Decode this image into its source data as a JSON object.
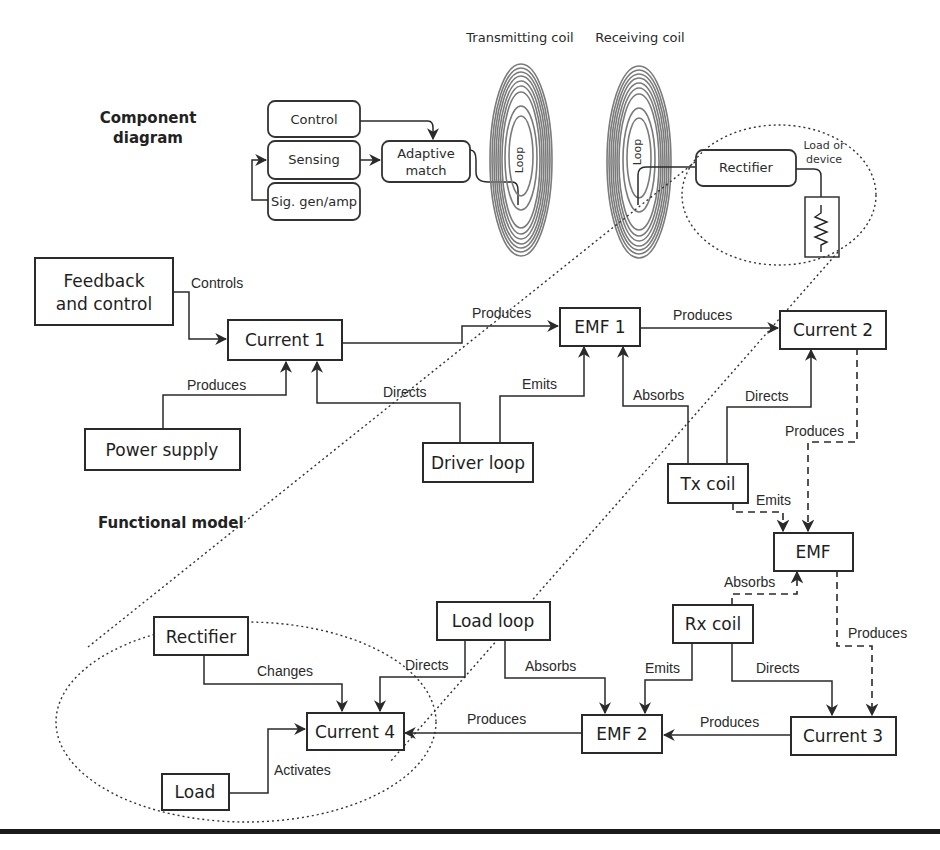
{
  "headings": {
    "component_diagram_line1": "Component",
    "component_diagram_line2": "diagram",
    "functional_model": "Functional model"
  },
  "component_diagram": {
    "transmitting_coil_label": "Transmitting coil",
    "receiving_coil_label": "Receiving coil",
    "tx_loop_label": "Loop",
    "rx_loop_label": "Loop",
    "blocks": {
      "control": "Control",
      "sensing": "Sensing",
      "sig_gen": "Sig. gen/amp",
      "adaptive_match_line1": "Adaptive",
      "adaptive_match_line2": "match",
      "rectifier": "Rectifier",
      "load_line1": "Load or",
      "load_line2": "device"
    }
  },
  "functional_model": {
    "nodes": {
      "feedback_line1": "Feedback",
      "feedback_line2": "and control",
      "current1": "Current 1",
      "power_supply": "Power supply",
      "driver_loop": "Driver loop",
      "emf1": "EMF 1",
      "current2": "Current 2",
      "tx_coil": "Tx coil",
      "emf": "EMF",
      "rx_coil": "Rx coil",
      "load_loop": "Load loop",
      "rectifier": "Rectifier",
      "current4": "Current 4",
      "load": "Load",
      "emf2": "EMF 2",
      "current3": "Current 3"
    },
    "edges": {
      "feedback_current1": "Controls",
      "power_current1": "Produces",
      "driver_current1": "Directs",
      "current1_emf1": "Produces",
      "driver_emf1": "Emits",
      "txcoil_emf1": "Absorbs",
      "emf1_current2": "Produces",
      "txcoil_current2": "Directs",
      "current2_emf": "Produces",
      "txcoil_emf": "Emits",
      "rxcoil_emf": "Absorbs",
      "emf_current3": "Produces",
      "rxcoil_emf2": "Emits",
      "rxcoil_current3": "Directs",
      "loadloop_emf2": "Absorbs",
      "loadloop_current4": "Directs",
      "current3_emf2": "Produces",
      "emf2_current4": "Produces",
      "rectifier_current4": "Changes",
      "load_current4": "Activates"
    }
  },
  "colors": {
    "ink": "#2a2a2a",
    "coil": "#7a7a7a",
    "background": "#ffffff"
  }
}
